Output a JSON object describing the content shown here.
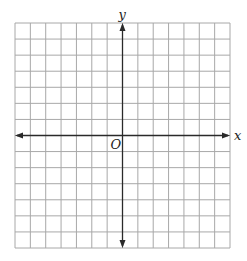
{
  "diagram": {
    "type": "coordinate-plane",
    "grid": {
      "columns": 14,
      "rows": 14,
      "x_range": [
        -7,
        7
      ],
      "y_range": [
        -7,
        7
      ]
    },
    "labels": {
      "x_axis": "x",
      "y_axis": "y",
      "origin": "O"
    },
    "colors": {
      "grid": "#a8a8a8",
      "axis": "#2a2a2a",
      "background": "#ffffff"
    }
  }
}
